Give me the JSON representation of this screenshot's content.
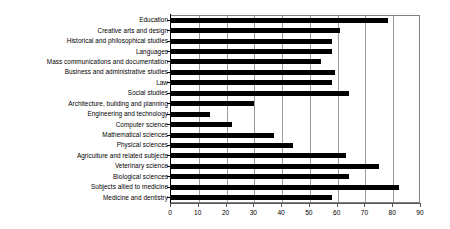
{
  "chart_data": {
    "type": "bar",
    "orientation": "horizontal",
    "title": "",
    "xlabel": "",
    "ylabel": "",
    "xlim": [
      0,
      90
    ],
    "xticks": [
      0,
      10,
      20,
      30,
      40,
      50,
      60,
      70,
      80,
      90
    ],
    "grid": true,
    "grid_axis": "x",
    "legend": null,
    "bar_color": "#000000",
    "background_color": "#ffffff",
    "categories": [
      "Education",
      "Creative arts and design",
      "Historical and philosophical studies",
      "Languages",
      "Mass communications and documentation",
      "Business and administrative studies",
      "Law",
      "Social studies",
      "Architecture, building and planning",
      "Engineering and technology",
      "Computer science",
      "Mathematical sciences",
      "Physical sciences",
      "Agriculture and related subjects",
      "Veterinary science",
      "Biological sciences",
      "Subjects allied to medicine",
      "Medicine and dentistry"
    ],
    "values": [
      78,
      61,
      58,
      58,
      54,
      59,
      58,
      64,
      30,
      14,
      22,
      37,
      44,
      63,
      75,
      64,
      82,
      58
    ]
  },
  "axis": {
    "tick_labels": [
      "0",
      "10",
      "20",
      "30",
      "40",
      "50",
      "60",
      "70",
      "80",
      "90"
    ]
  }
}
